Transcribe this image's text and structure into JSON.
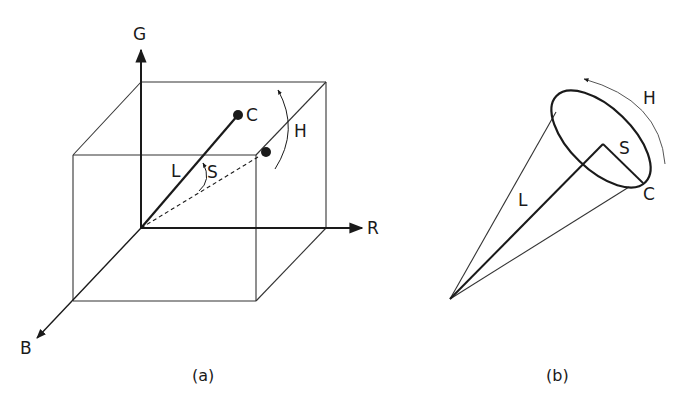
{
  "figure_a": {
    "caption": "(a)",
    "axes": {
      "g": "G",
      "r": "R",
      "b": "B"
    },
    "labels": {
      "c": "C",
      "h": "H",
      "l": "L",
      "s": "S"
    }
  },
  "figure_b": {
    "caption": "(b)",
    "labels": {
      "c": "C",
      "h": "H",
      "l": "L",
      "s": "S"
    }
  },
  "colors": {
    "line": "#1a1a1a",
    "thin": "#333333",
    "background": "#ffffff"
  }
}
